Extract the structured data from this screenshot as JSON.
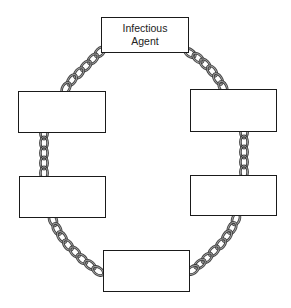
{
  "diagram": {
    "boxes": [
      {
        "id": "top",
        "label": "Infectious\nAgent"
      },
      {
        "id": "right1",
        "label": ""
      },
      {
        "id": "right2",
        "label": ""
      },
      {
        "id": "bottom",
        "label": ""
      },
      {
        "id": "left2",
        "label": ""
      },
      {
        "id": "left1",
        "label": ""
      }
    ],
    "connectors": [
      {
        "from": "top",
        "to": "right1",
        "type": "chain"
      },
      {
        "from": "right1",
        "to": "right2",
        "type": "chain"
      },
      {
        "from": "right2",
        "to": "bottom",
        "type": "chain"
      },
      {
        "from": "bottom",
        "to": "left2",
        "type": "chain"
      },
      {
        "from": "left2",
        "to": "left1",
        "type": "chain"
      },
      {
        "from": "left1",
        "to": "top",
        "type": "chain"
      }
    ],
    "colors": {
      "box_border": "#1a1a1a",
      "chain_stroke": "#3a3a3a",
      "chain_fill": "#9a9a9a",
      "background": "#ffffff"
    }
  }
}
